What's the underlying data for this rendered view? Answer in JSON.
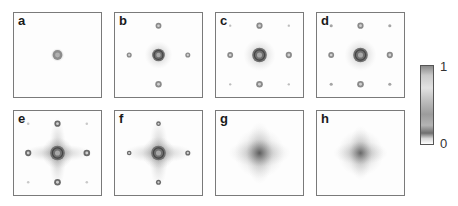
{
  "figure": {
    "panels": [
      {
        "label": "a",
        "pattern": "central-spot"
      },
      {
        "label": "b",
        "pattern": "central-spot-4-side-peaks"
      },
      {
        "label": "c",
        "pattern": "central-ring-4-side-peaks-4-faint-corner-peaks"
      },
      {
        "label": "d",
        "pattern": "central-ring-4-side-peaks-4-corner-peaks"
      },
      {
        "label": "e",
        "pattern": "broadened-cross-with-side-and-corner-peaks"
      },
      {
        "label": "f",
        "pattern": "broadened-cross-with-side-peaks"
      },
      {
        "label": "g",
        "pattern": "diffuse-blob"
      },
      {
        "label": "h",
        "pattern": "faint-diffuse-blob"
      }
    ],
    "colorbar": {
      "max_label": "1",
      "min_label": "0",
      "colormap": "grayscale"
    }
  }
}
